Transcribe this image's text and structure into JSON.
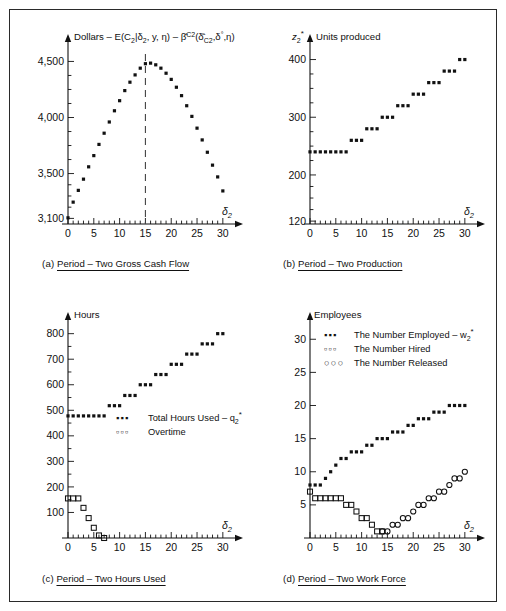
{
  "figure": {
    "background": "#ffffff",
    "border_color": "#2a2a2a",
    "marker_color": "#111111"
  },
  "panels": {
    "a": {
      "caption_index": "(a)",
      "caption_text": "Period – Two Gross Cash Flow",
      "axis_title": "Dollars – E(C2|δ2, y, η) – β̂C2(δ̂C2, δ°, η)",
      "xlabel": "δ2",
      "yticks": [
        3100,
        3500,
        4000,
        4500
      ],
      "ytick_labels": [
        "3,100",
        "3,500",
        "4,000",
        "4,500"
      ],
      "xticks": [
        0,
        5,
        10,
        15,
        20,
        25,
        30
      ],
      "xtick_labels": [
        "0",
        "5",
        "10",
        "15",
        "20",
        "25",
        "30"
      ],
      "ylim": [
        3050,
        4620
      ],
      "xlim": [
        0,
        31
      ],
      "marker_line_x": 15
    },
    "b": {
      "caption_index": "(b)",
      "caption_text": "Period – Two Production",
      "axis_title": "Units produced",
      "yvar": "z2*",
      "xlabel": "δ2",
      "yticks": [
        120,
        200,
        300,
        400
      ],
      "ytick_labels": [
        "120",
        "200",
        "300",
        "400"
      ],
      "xticks": [
        0,
        5,
        10,
        15,
        20,
        25,
        30
      ],
      "xtick_labels": [
        "0",
        "5",
        "10",
        "15",
        "20",
        "25",
        "30"
      ],
      "ylim": [
        115,
        420
      ],
      "xlim": [
        0,
        31
      ]
    },
    "c": {
      "caption_index": "(c)",
      "caption_text": "Period – Two Hours Used",
      "axis_title": "Hours",
      "xlabel": "δ2",
      "yticks": [
        100,
        200,
        300,
        400,
        500,
        600,
        700,
        800
      ],
      "ytick_labels": [
        "100",
        "200",
        "300",
        "400",
        "500",
        "600",
        "700",
        "800"
      ],
      "xticks": [
        0,
        5,
        10,
        15,
        20,
        25,
        30
      ],
      "xtick_labels": [
        "0",
        "5",
        "10",
        "15",
        "20",
        "25",
        "30"
      ],
      "ylim": [
        0,
        830
      ],
      "xlim": [
        0,
        31
      ],
      "legend": [
        {
          "symbol": "•••",
          "label": "Total Hours Used – q2*"
        },
        {
          "symbol": "▫▫▫",
          "label": "Overtime"
        }
      ]
    },
    "d": {
      "caption_index": "(d)",
      "caption_text": "Period – Two Work Force",
      "axis_title": "Employees",
      "xlabel": "δ2",
      "yticks": [
        5,
        10,
        15,
        20,
        25,
        30
      ],
      "ytick_labels": [
        "5",
        "10",
        "15",
        "20",
        "25",
        "30"
      ],
      "xticks": [
        0,
        5,
        10,
        15,
        20,
        25,
        30
      ],
      "xtick_labels": [
        "0",
        "5",
        "10",
        "15",
        "20",
        "25",
        "30"
      ],
      "ylim": [
        0,
        32
      ],
      "xlim": [
        0,
        31
      ],
      "legend": [
        {
          "symbol": "•••",
          "label": "The Number Employed – w2*"
        },
        {
          "symbol": "▫▫▫",
          "label": "The Number Hired"
        },
        {
          "symbol": "○○○",
          "label": "The Number Released"
        }
      ]
    }
  },
  "chart_data": [
    {
      "id": "a",
      "type": "scatter",
      "title": "Period – Two Gross Cash Flow",
      "xlabel": "δ2",
      "ylabel": "Dollars – E(C2|δ2, y, η) – β̂C2(δ̂C2, δ°, η)",
      "xlim": [
        0,
        31
      ],
      "ylim": [
        3050,
        4620
      ],
      "grid": false,
      "annotation_vline_x": 15,
      "x": [
        0,
        1,
        2,
        3,
        4,
        5,
        6,
        7,
        8,
        9,
        10,
        11,
        12,
        13,
        14,
        15,
        16,
        17,
        18,
        19,
        20,
        21,
        22,
        23,
        24,
        25,
        26,
        27,
        28,
        29,
        30
      ],
      "values": [
        3105,
        3245,
        3350,
        3450,
        3560,
        3660,
        3760,
        3860,
        3960,
        4060,
        4150,
        4240,
        4315,
        4380,
        4440,
        4480,
        4485,
        4470,
        4440,
        4395,
        4340,
        4270,
        4195,
        4105,
        4010,
        3905,
        3800,
        3690,
        3575,
        3470,
        3345
      ]
    },
    {
      "id": "b",
      "type": "scatter",
      "title": "Period – Two Production",
      "xlabel": "δ2",
      "ylabel": "Units produced",
      "xlim": [
        0,
        31
      ],
      "ylim": [
        115,
        420
      ],
      "grid": false,
      "x": [
        0,
        1,
        2,
        3,
        4,
        5,
        6,
        7,
        8,
        9,
        10,
        11,
        12,
        13,
        14,
        15,
        16,
        17,
        18,
        19,
        20,
        21,
        22,
        23,
        24,
        25,
        26,
        27,
        28,
        29,
        30
      ],
      "values": [
        240,
        240,
        240,
        240,
        240,
        240,
        240,
        240,
        260,
        260,
        260,
        280,
        280,
        280,
        300,
        300,
        300,
        320,
        320,
        320,
        340,
        340,
        340,
        360,
        360,
        360,
        380,
        380,
        380,
        400,
        400
      ]
    },
    {
      "id": "c",
      "type": "scatter",
      "title": "Period – Two Hours Used",
      "xlabel": "δ2",
      "ylabel": "Hours",
      "xlim": [
        0,
        31
      ],
      "ylim": [
        0,
        830
      ],
      "grid": false,
      "series": [
        {
          "name": "Total Hours Used – q2*",
          "marker": "filled",
          "x": [
            0,
            1,
            2,
            3,
            4,
            5,
            6,
            7,
            8,
            9,
            10,
            11,
            12,
            13,
            14,
            15,
            16,
            17,
            18,
            19,
            20,
            21,
            22,
            23,
            24,
            25,
            26,
            27,
            28,
            29,
            30
          ],
          "values": [
            478,
            478,
            478,
            478,
            478,
            478,
            478,
            478,
            518,
            518,
            518,
            558,
            558,
            558,
            600,
            600,
            600,
            640,
            640,
            640,
            680,
            680,
            680,
            720,
            720,
            720,
            760,
            760,
            760,
            800,
            800
          ]
        },
        {
          "name": "Overtime",
          "marker": "open-square",
          "x": [
            0,
            1,
            2,
            3,
            4,
            5,
            6,
            7
          ],
          "values": [
            155,
            155,
            155,
            118,
            78,
            40,
            10,
            0
          ]
        }
      ]
    },
    {
      "id": "d",
      "type": "scatter",
      "title": "Period – Two Work Force",
      "xlabel": "δ2",
      "ylabel": "Employees",
      "xlim": [
        0,
        31
      ],
      "ylim": [
        0,
        32
      ],
      "grid": false,
      "series": [
        {
          "name": "The Number Employed – w2*",
          "marker": "filled",
          "x": [
            0,
            1,
            2,
            3,
            4,
            5,
            6,
            7,
            8,
            9,
            10,
            11,
            12,
            13,
            14,
            15,
            16,
            17,
            18,
            19,
            20,
            21,
            22,
            23,
            24,
            25,
            26,
            27,
            28,
            29,
            30
          ],
          "values": [
            8,
            8,
            8,
            9,
            10,
            11,
            12,
            12,
            13,
            13,
            13,
            14,
            14,
            15,
            15,
            15,
            16,
            16,
            16,
            17,
            17,
            18,
            18,
            18,
            19,
            19,
            19,
            20,
            20,
            20,
            20
          ]
        },
        {
          "name": "The Number Hired",
          "marker": "open-square",
          "x": [
            0,
            1,
            2,
            3,
            4,
            5,
            6,
            7,
            8,
            9,
            10,
            11,
            12,
            13,
            14
          ],
          "values": [
            7,
            6,
            6,
            6,
            6,
            6,
            6,
            5,
            5,
            4,
            3,
            3,
            2,
            1,
            1
          ]
        },
        {
          "name": "The Number Released",
          "marker": "open-circle",
          "x": [
            14,
            15,
            16,
            17,
            18,
            19,
            20,
            21,
            22,
            23,
            24,
            25,
            26,
            27,
            28,
            29,
            30
          ],
          "values": [
            1,
            1,
            2,
            2,
            3,
            3,
            4,
            5,
            5,
            6,
            6,
            7,
            7,
            8,
            9,
            9,
            10
          ]
        }
      ]
    }
  ]
}
